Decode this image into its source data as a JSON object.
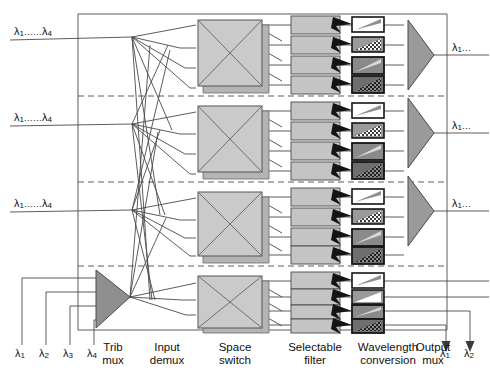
{
  "diagram": {
    "columns": [
      {
        "id": "trib-mux",
        "line1": "Trib",
        "line2": "mux",
        "x": 112
      },
      {
        "id": "input-demux",
        "line1": "Input",
        "line2": "demux",
        "x": 165
      },
      {
        "id": "space-switch",
        "line1": "Space",
        "line2": "switch",
        "x": 235
      },
      {
        "id": "selectable-filter",
        "line1": "Selectable",
        "line2": "filter",
        "x": 315
      },
      {
        "id": "wavelength-conversion",
        "line1": "Wavelength",
        "line2": "conversion",
        "x": 388
      },
      {
        "id": "output-mux",
        "line1": "Output",
        "line2": "mux",
        "x": 436
      }
    ],
    "input_labels": [
      {
        "id": "input-row-1",
        "lambda": "λ",
        "from": "1",
        "dots": "......",
        "to": "4",
        "x": 14,
        "y": 26
      },
      {
        "id": "input-row-2",
        "lambda": "λ",
        "from": "1",
        "dots": "......",
        "to": "4",
        "x": 14,
        "y": 112
      },
      {
        "id": "input-row-3",
        "lambda": "λ",
        "from": "1",
        "dots": "......",
        "to": "4",
        "x": 14,
        "y": 198
      }
    ],
    "output_labels": [
      {
        "id": "output-row-1",
        "text": "λ",
        "sub": "1",
        "dots": "...",
        "x": 452,
        "y": 52
      },
      {
        "id": "output-row-2",
        "text": "λ",
        "sub": "1",
        "dots": "...",
        "x": 452,
        "y": 130
      },
      {
        "id": "output-row-3",
        "text": "λ",
        "sub": "1",
        "dots": "...",
        "x": 452,
        "y": 208
      }
    ],
    "trib_inputs": [
      {
        "id": "trib-lambda-1",
        "text": "λ",
        "sub": "1",
        "x": 16,
        "y": 352
      },
      {
        "id": "trib-lambda-2",
        "text": "λ",
        "sub": "2",
        "x": 40,
        "y": 352
      },
      {
        "id": "trib-lambda-3",
        "text": "λ",
        "sub": "3",
        "x": 64,
        "y": 352
      },
      {
        "id": "trib-lambda-4",
        "text": "λ",
        "sub": "4",
        "x": 88,
        "y": 352
      }
    ],
    "drop_outputs": [
      {
        "id": "drop-lambda-1",
        "text": "λ",
        "sub": "1",
        "x": 448,
        "y": 352
      },
      {
        "id": "drop-lambda-2",
        "text": "λ",
        "sub": "2",
        "x": 472,
        "y": 352
      }
    ],
    "colors": {
      "line": "#4a4a4a",
      "block_fill": "#c8c8c8",
      "switch_fill": "#cacaca",
      "triangle_fill": "#9a9a9a",
      "dark": "#2b2b2b",
      "border": "#555555",
      "white": "#ffffff"
    }
  }
}
